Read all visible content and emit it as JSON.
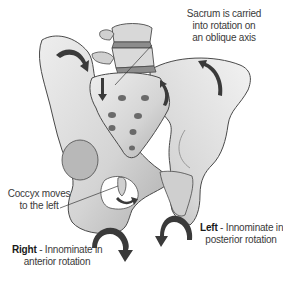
{
  "figure": {
    "colors": {
      "bone_fill": "#dcdcdc",
      "bone_shade": "#a8a8a8",
      "bone_outline": "#4a4a4a",
      "arrow": "#3a3a3a",
      "text": "#3a3a3a",
      "background": "#ffffff"
    }
  },
  "labels": {
    "sacrum": {
      "line1": "Sacrum is carried",
      "line2": "into rotation on",
      "line3": "an oblique axis"
    },
    "coccyx": {
      "line1": "Coccyx moves",
      "line2": "to the left"
    },
    "right": {
      "bold": "Right",
      "line1_rest": " - Innominate in",
      "line2": "anterior rotation"
    },
    "left": {
      "bold": "Left",
      "line1_rest": " - Innominate in",
      "line2": "posterior rotation"
    }
  },
  "arrows": [
    {
      "name": "right-iliac-crest-arrow",
      "direction": "clockwise-down"
    },
    {
      "name": "sacrum-left-arrow",
      "direction": "down"
    },
    {
      "name": "sacrum-right-arrow",
      "direction": "up"
    },
    {
      "name": "left-iliac-arrow",
      "direction": "up"
    },
    {
      "name": "coccyx-arrow",
      "direction": "right"
    },
    {
      "name": "right-innominate-arrow",
      "direction": "anterior-down"
    },
    {
      "name": "left-innominate-arrow",
      "direction": "posterior-down"
    }
  ]
}
